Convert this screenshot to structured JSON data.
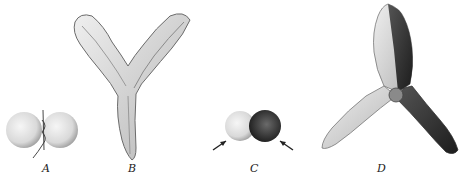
{
  "figure": {
    "panels": [
      {
        "id": "A",
        "label": "A",
        "description": "two round lobes joined by a thread"
      },
      {
        "id": "B",
        "label": "B",
        "description": "Y-shaped structure with two wavy-edged arms and a tapered stalk"
      },
      {
        "id": "C",
        "label": "C",
        "description": "pair of lobes, one light and one dark, with arrows"
      },
      {
        "id": "D",
        "label": "D",
        "description": "three-armed structure, half light half dark shaded"
      }
    ],
    "colors": {
      "background": "#ffffff",
      "ink": "#222222",
      "light_tone": "#d8d8d8",
      "dark_tone": "#3a3a3a"
    }
  }
}
